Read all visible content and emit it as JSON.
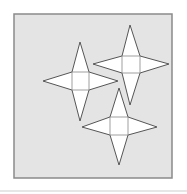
{
  "diagram": {
    "type": "star-nets",
    "colors": {
      "page_background": "#ffffff",
      "panel_fill": "#e4e4e4",
      "panel_border": "#8a8a8a",
      "shape_fill": "#ffffff",
      "shape_stroke": "#555555",
      "inner_line": "#888888"
    },
    "panel": {
      "x": 14,
      "y": 14,
      "width": 158,
      "height": 164
    },
    "stars": [
      {
        "name": "star-left",
        "center": [
          80,
          81
        ],
        "square": {
          "x1": 72,
          "y1": 72,
          "x2": 89,
          "y2": 90
        },
        "tips": {
          "top": [
            80,
            42
          ],
          "left": [
            43,
            81
          ],
          "right": [
            118,
            81
          ],
          "bottom": [
            80,
            121
          ]
        }
      },
      {
        "name": "star-top-right",
        "center": [
          131,
          64
        ],
        "square": {
          "x1": 122,
          "y1": 56,
          "x2": 140,
          "y2": 73
        },
        "tips": {
          "top": [
            130,
            25
          ],
          "left": [
            93,
            64
          ],
          "right": [
            169,
            64
          ],
          "bottom": [
            130,
            105
          ]
        }
      },
      {
        "name": "star-bottom",
        "center": [
          119,
          126
        ],
        "square": {
          "x1": 110,
          "y1": 117,
          "x2": 128,
          "y2": 135
        },
        "tips": {
          "top": [
            119,
            88
          ],
          "left": [
            82,
            127
          ],
          "right": [
            157,
            127
          ],
          "bottom": [
            119,
            165
          ]
        }
      }
    ]
  }
}
